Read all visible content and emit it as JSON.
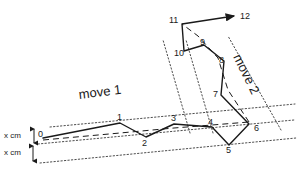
{
  "figure": {
    "background_color": "#ffffff",
    "stroke_color": "#1a1a1a",
    "dotted_color": "#4d4d4d",
    "width": 297,
    "height": 172
  },
  "bands": [
    {
      "id": "move1",
      "label": "move 1",
      "x": 78,
      "y": 88,
      "rotation": -7
    },
    {
      "id": "move2",
      "label": "move 2",
      "x": 243,
      "y": 52,
      "rotation": 64
    }
  ],
  "dimensions": [
    {
      "id": "top-gap",
      "label": "x cm",
      "x": 4,
      "y": 132
    },
    {
      "id": "bottom-gap",
      "label": "x cm",
      "x": 4,
      "y": 149
    }
  ],
  "nodes": [
    {
      "id": "0",
      "label": "0",
      "x": 43,
      "y": 138,
      "label_x": 38,
      "label_y": 130
    },
    {
      "id": "1",
      "label": "1",
      "x": 120,
      "y": 123,
      "label_x": 117,
      "label_y": 113
    },
    {
      "id": "2",
      "label": "2",
      "x": 146,
      "y": 137,
      "label_x": 142,
      "label_y": 139
    },
    {
      "id": "3",
      "label": "3",
      "x": 174,
      "y": 124,
      "label_x": 171,
      "label_y": 114
    },
    {
      "id": "4",
      "label": "4",
      "x": 212,
      "y": 127,
      "label_x": 208,
      "label_y": 118
    },
    {
      "id": "5",
      "label": "5",
      "x": 229,
      "y": 145,
      "label_x": 226,
      "label_y": 146
    },
    {
      "id": "6",
      "label": "6",
      "x": 249,
      "y": 124,
      "label_x": 254,
      "label_y": 124
    },
    {
      "id": "7",
      "label": "7",
      "x": 221,
      "y": 95,
      "label_x": 213,
      "label_y": 90
    },
    {
      "id": "8",
      "label": "8",
      "x": 224,
      "y": 61,
      "label_x": 219,
      "label_y": 56
    },
    {
      "id": "9",
      "label": "9",
      "x": 204,
      "y": 45,
      "label_x": 200,
      "label_y": 38
    },
    {
      "id": "10",
      "label": "10",
      "x": 184,
      "y": 51,
      "label_x": 174,
      "label_y": 49
    },
    {
      "id": "11",
      "label": "11",
      "x": 182,
      "y": 24,
      "label_x": 169,
      "label_y": 16
    },
    {
      "id": "12",
      "label": "12",
      "x": 238,
      "y": 16,
      "label_x": 240,
      "label_y": 12
    }
  ],
  "path": {
    "description": "solid zigzag route through waypoints 0 to 11",
    "points": "43,138 120,123 146,137 174,124 212,127 229,145 249,124 221,95 224,61 204,45 184,51 182,24"
  },
  "arrow": {
    "description": "arrow from waypoint 11 toward label 12",
    "from_x": 182,
    "from_y": 24,
    "to_x": 234,
    "to_y": 16
  },
  "centerlines": [
    {
      "id": "move1-center",
      "points": "43,140 120,133 174,128 212,125 249,122"
    },
    {
      "id": "move2-center",
      "points": "249,122 228,90 218,58 198,36 182,24"
    }
  ],
  "corridors": [
    {
      "id": "move1-top",
      "points": "50,127 295,104"
    },
    {
      "id": "move1-middle",
      "points": "38,144 294,120"
    },
    {
      "id": "move1-bottom",
      "points": "40,163 296,138"
    },
    {
      "id": "move2-left",
      "points": "190,133 163,40"
    },
    {
      "id": "move2-middle",
      "points": "213,133 186,40"
    },
    {
      "id": "move2-right",
      "points": "281,130 228,36"
    }
  ]
}
